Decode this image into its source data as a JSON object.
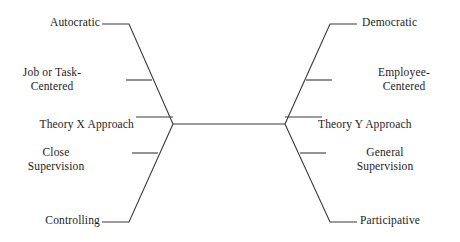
{
  "diagram": {
    "type": "fishbone-comparison",
    "background_color": "#ffffff",
    "line_color": "#3a3a3a",
    "text_color": "#1c1c1c",
    "left_branch": {
      "anchor_label": "Theory X Approach",
      "items": [
        {
          "label": "Autocratic",
          "position": "top"
        },
        {
          "label": "Job or Task-\nCentered",
          "position": "upper-middle"
        },
        {
          "label": "Theory X Approach",
          "position": "center"
        },
        {
          "label": "Close\nSupervision",
          "position": "lower-middle"
        },
        {
          "label": "Controlling",
          "position": "bottom"
        }
      ]
    },
    "right_branch": {
      "anchor_label": "Theory Y Approach",
      "items": [
        {
          "label": "Democratic",
          "position": "top"
        },
        {
          "label": "Employee-\nCentered",
          "position": "upper-middle"
        },
        {
          "label": "Theory Y Approach",
          "position": "center"
        },
        {
          "label": "General\nSupervision",
          "position": "lower-middle"
        },
        {
          "label": "Participative",
          "position": "bottom"
        }
      ]
    }
  }
}
